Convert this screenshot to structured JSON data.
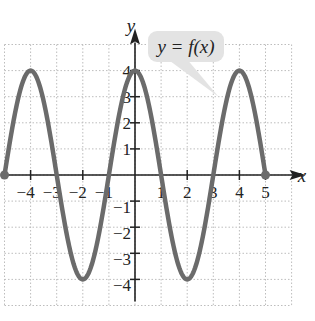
{
  "chart_data": {
    "type": "line",
    "title": "",
    "xlabel": "x",
    "ylabel": "y",
    "xlim": [
      -5,
      6
    ],
    "ylim": [
      -5,
      5
    ],
    "grid": true,
    "x_ticks": [
      -4,
      -3,
      -2,
      -1,
      1,
      2,
      3,
      4,
      5
    ],
    "y_ticks": [
      -4,
      -3,
      -2,
      -1,
      1,
      2,
      3,
      4
    ],
    "x_tick_labels": [
      "−4",
      "−3",
      "−2",
      "−1",
      "1",
      "2",
      "3",
      "4",
      "5"
    ],
    "y_tick_labels": [
      "−4",
      "−3",
      "−2",
      "−1",
      "1",
      "2",
      "3",
      "4"
    ],
    "series": [
      {
        "name": "y = f(x)",
        "color": "#6b6b6b",
        "domain": [
          -5,
          5
        ],
        "key_points": [
          {
            "x": -5,
            "y": 0
          },
          {
            "x": -4,
            "y": 4
          },
          {
            "x": -3,
            "y": 0
          },
          {
            "x": -2,
            "y": -4
          },
          {
            "x": -1,
            "y": 0
          },
          {
            "x": 0,
            "y": 4
          },
          {
            "x": 1,
            "y": 0
          },
          {
            "x": 2,
            "y": -4
          },
          {
            "x": 3,
            "y": 0
          },
          {
            "x": 4,
            "y": 4
          },
          {
            "x": 5,
            "y": 0
          }
        ],
        "endpoints_closed": [
          {
            "x": -5,
            "y": 0
          },
          {
            "x": 5,
            "y": 0
          }
        ]
      }
    ],
    "annotations": [
      {
        "text": "y = f(x)",
        "type": "callout",
        "points_to": {
          "x": 3.2,
          "y": 3
        }
      }
    ]
  },
  "labels": {
    "x_axis": "x",
    "y_axis": "y",
    "curve_label": "y = f(x)"
  },
  "colors": {
    "curve": "#6b6b6b",
    "axis": "#222222",
    "grid": "#bdbdbd",
    "bubble": "#e3e3e3"
  }
}
